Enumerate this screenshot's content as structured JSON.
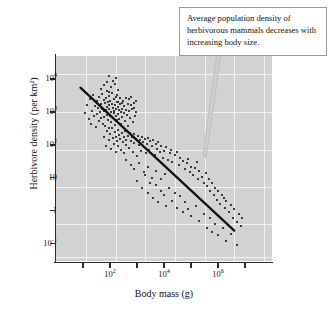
{
  "chart_data": {
    "type": "scatter",
    "title": "",
    "xlabel": "Body mass (g)",
    "ylabel": "Herbivore density (per km²)",
    "xscale": "log",
    "yscale": "log",
    "xlim": [
      1,
      100000000
    ],
    "ylim": [
      0.03,
      50000
    ],
    "grid": true,
    "legend": null,
    "annotation": "Average population density of herbivorous mammals decreases with increasing body size.",
    "y_ticks": [
      {
        "value": 10000,
        "label": "10",
        "exponent": "4"
      },
      {
        "value": 1000,
        "label": "10",
        "exponent": "3"
      },
      {
        "value": 100,
        "label": "10",
        "exponent": "2"
      },
      {
        "value": 10,
        "label": "10",
        "exponent": ""
      },
      {
        "value": 1,
        "label": "1",
        "exponent": ""
      },
      {
        "value": 0.1,
        "label": "10",
        "exponent": "-1"
      }
    ],
    "x_ticks": [
      {
        "value": 100,
        "label": "10",
        "exponent": "2"
      },
      {
        "value": 10000,
        "label": "10",
        "exponent": "4"
      },
      {
        "value": 1000000,
        "label": "10",
        "exponent": "6"
      }
    ],
    "x_minor_ticks": [
      10,
      1000,
      100000,
      10000000
    ],
    "trend_line": {
      "description": "negative log-log regression line",
      "x_start": 8,
      "y_start": 5500,
      "x_end": 4000000,
      "y_end": 0.25,
      "slope": -0.75,
      "color": "#111111"
    },
    "points": [
      [
        12,
        900
      ],
      [
        14,
        1600
      ],
      [
        16,
        620
      ],
      [
        18,
        2400
      ],
      [
        20,
        430
      ],
      [
        22,
        1100
      ],
      [
        24,
        3200
      ],
      [
        26,
        760
      ],
      [
        28,
        1500
      ],
      [
        30,
        340
      ],
      [
        32,
        2100
      ],
      [
        34,
        880
      ],
      [
        36,
        1300
      ],
      [
        38,
        520
      ],
      [
        40,
        2800
      ],
      [
        42,
        980
      ],
      [
        45,
        1750
      ],
      [
        48,
        640
      ],
      [
        50,
        3600
      ],
      [
        52,
        1200
      ],
      [
        55,
        420
      ],
      [
        58,
        2300
      ],
      [
        60,
        1050
      ],
      [
        62,
        700
      ],
      [
        65,
        1900
      ],
      [
        68,
        380
      ],
      [
        70,
        2600
      ],
      [
        72,
        1150
      ],
      [
        75,
        830
      ],
      [
        78,
        4200
      ],
      [
        80,
        1400
      ],
      [
        82,
        560
      ],
      [
        85,
        2000
      ],
      [
        88,
        1250
      ],
      [
        90,
        320
      ],
      [
        92,
        3100
      ],
      [
        95,
        1600
      ],
      [
        98,
        740
      ],
      [
        100,
        2200
      ],
      [
        105,
        1000
      ],
      [
        110,
        480
      ],
      [
        115,
        1800
      ],
      [
        120,
        3800
      ],
      [
        125,
        1350
      ],
      [
        130,
        650
      ],
      [
        135,
        2500
      ],
      [
        140,
        1100
      ],
      [
        145,
        900
      ],
      [
        150,
        1650
      ],
      [
        155,
        400
      ],
      [
        160,
        2900
      ],
      [
        165,
        1200
      ],
      [
        170,
        760
      ],
      [
        175,
        1950
      ],
      [
        180,
        560
      ],
      [
        185,
        3300
      ],
      [
        190,
        1450
      ],
      [
        195,
        880
      ],
      [
        200,
        2050
      ],
      [
        210,
        1150
      ],
      [
        220,
        620
      ],
      [
        230,
        1700
      ],
      [
        240,
        2600
      ],
      [
        250,
        1000
      ],
      [
        260,
        440
      ],
      [
        270,
        1900
      ],
      [
        280,
        1250
      ],
      [
        290,
        700
      ],
      [
        300,
        2200
      ],
      [
        320,
        950
      ],
      [
        340,
        1500
      ],
      [
        360,
        520
      ],
      [
        380,
        2700
      ],
      [
        400,
        1150
      ],
      [
        420,
        820
      ],
      [
        450,
        1800
      ],
      [
        480,
        380
      ],
      [
        500,
        2400
      ],
      [
        520,
        1050
      ],
      [
        550,
        640
      ],
      [
        580,
        1600
      ],
      [
        600,
        2900
      ],
      [
        650,
        1200
      ],
      [
        700,
        480
      ],
      [
        750,
        1900
      ],
      [
        800,
        1350
      ],
      [
        850,
        760
      ],
      [
        900,
        2100
      ],
      [
        950,
        1000
      ],
      [
        60,
        180
      ],
      [
        70,
        95
      ],
      [
        80,
        260
      ],
      [
        90,
        140
      ],
      [
        100,
        210
      ],
      [
        110,
        75
      ],
      [
        120,
        320
      ],
      [
        130,
        160
      ],
      [
        140,
        110
      ],
      [
        150,
        240
      ],
      [
        160,
        60
      ],
      [
        170,
        180
      ],
      [
        180,
        130
      ],
      [
        190,
        280
      ],
      [
        200,
        90
      ],
      [
        220,
        200
      ],
      [
        240,
        150
      ],
      [
        260,
        70
      ],
      [
        280,
        230
      ],
      [
        300,
        120
      ],
      [
        320,
        175
      ],
      [
        340,
        55
      ],
      [
        360,
        260
      ],
      [
        380,
        140
      ],
      [
        400,
        100
      ],
      [
        450,
        190
      ],
      [
        500,
        80
      ],
      [
        550,
        230
      ],
      [
        600,
        130
      ],
      [
        650,
        170
      ],
      [
        700,
        60
      ],
      [
        750,
        210
      ],
      [
        800,
        115
      ],
      [
        900,
        155
      ],
      [
        1000,
        45
      ],
      [
        1100,
        190
      ],
      [
        1200,
        100
      ],
      [
        1300,
        140
      ],
      [
        1400,
        65
      ],
      [
        1500,
        175
      ],
      [
        1600,
        120
      ],
      [
        1800,
        85
      ],
      [
        2000,
        150
      ],
      [
        2200,
        55
      ],
      [
        2400,
        110
      ],
      [
        2600,
        160
      ],
      [
        2800,
        70
      ],
      [
        3000,
        130
      ],
      [
        3500,
        95
      ],
      [
        4000,
        145
      ],
      [
        4500,
        50
      ],
      [
        5000,
        105
      ],
      [
        5500,
        75
      ],
      [
        6000,
        120
      ],
      [
        7000,
        60
      ],
      [
        8000,
        90
      ],
      [
        9000,
        40
      ],
      [
        10000,
        65
      ],
      [
        12000,
        85
      ],
      [
        14000,
        35
      ],
      [
        16000,
        55
      ],
      [
        18000,
        70
      ],
      [
        20000,
        30
      ],
      [
        25000,
        48
      ],
      [
        30000,
        60
      ],
      [
        35000,
        25
      ],
      [
        40000,
        40
      ],
      [
        50000,
        32
      ],
      [
        60000,
        18
      ],
      [
        70000,
        28
      ],
      [
        80000,
        38
      ],
      [
        90000,
        15
      ],
      [
        100000,
        22
      ],
      [
        120000,
        12
      ],
      [
        140000,
        20
      ],
      [
        160000,
        30
      ],
      [
        180000,
        9
      ],
      [
        200000,
        16
      ],
      [
        250000,
        11
      ],
      [
        300000,
        7
      ],
      [
        350000,
        14
      ],
      [
        400000,
        5.5
      ],
      [
        450000,
        9
      ],
      [
        500000,
        4
      ],
      [
        600000,
        7
      ],
      [
        700000,
        3
      ],
      [
        800000,
        5
      ],
      [
        900000,
        2.2
      ],
      [
        1000000,
        4
      ],
      [
        1200000,
        1.6
      ],
      [
        1400000,
        3
      ],
      [
        1600000,
        2.4
      ],
      [
        1800000,
        1.2
      ],
      [
        2000000,
        2
      ],
      [
        2500000,
        0.9
      ],
      [
        3000000,
        1.5
      ],
      [
        3500000,
        0.6
      ],
      [
        4000000,
        1.1
      ],
      [
        5000000,
        0.45
      ],
      [
        6000000,
        0.8
      ],
      [
        7000000,
        0.35
      ],
      [
        8000000,
        0.6
      ],
      [
        1000,
        8
      ],
      [
        1500,
        5
      ],
      [
        2000,
        12
      ],
      [
        2500,
        3.5
      ],
      [
        3000,
        7
      ],
      [
        4000,
        2.5
      ],
      [
        5000,
        6
      ],
      [
        6000,
        1.8
      ],
      [
        8000,
        4
      ],
      [
        10000,
        3
      ],
      [
        12000,
        1.4
      ],
      [
        15000,
        5
      ],
      [
        20000,
        2
      ],
      [
        25000,
        3.5
      ],
      [
        30000,
        1.2
      ],
      [
        40000,
        2.8
      ],
      [
        50000,
        0.9
      ],
      [
        60000,
        1.8
      ],
      [
        80000,
        1.1
      ],
      [
        100000,
        0.7
      ],
      [
        150000,
        1.4
      ],
      [
        200000,
        0.5
      ],
      [
        300000,
        0.8
      ],
      [
        400000,
        0.3
      ],
      [
        500000,
        0.6
      ],
      [
        600000,
        0.22
      ],
      [
        800000,
        0.4
      ],
      [
        1000000,
        0.18
      ],
      [
        1500000,
        0.3
      ],
      [
        2000000,
        0.12
      ],
      [
        3000000,
        0.2
      ],
      [
        5000000,
        0.09
      ],
      [
        400,
        35
      ],
      [
        600,
        25
      ],
      [
        800,
        18
      ],
      [
        1200,
        28
      ],
      [
        1800,
        15
      ],
      [
        2600,
        22
      ],
      [
        3600,
        10
      ],
      [
        5200,
        16
      ],
      [
        7500,
        9
      ],
      [
        11000,
        13
      ],
      [
        90,
        4000
      ],
      [
        110,
        5600
      ],
      [
        130,
        9000
      ],
      [
        95,
        12000
      ],
      [
        150,
        7000
      ],
      [
        60,
        6500
      ],
      [
        75,
        8200
      ],
      [
        200,
        4500
      ],
      [
        170,
        11000
      ],
      [
        45,
        5000
      ]
    ]
  },
  "plot": {
    "bg_color": "#d2d2d2",
    "grid_color": "#f2f2f2",
    "point_color": "#3b3b3b",
    "axis_color": "#2b2b2b"
  },
  "callout": {
    "text": "Average population density of herbivorous mammals decreases with increasing body size.",
    "border_color": "#9a9a9a",
    "background_color": "#ffffff"
  }
}
